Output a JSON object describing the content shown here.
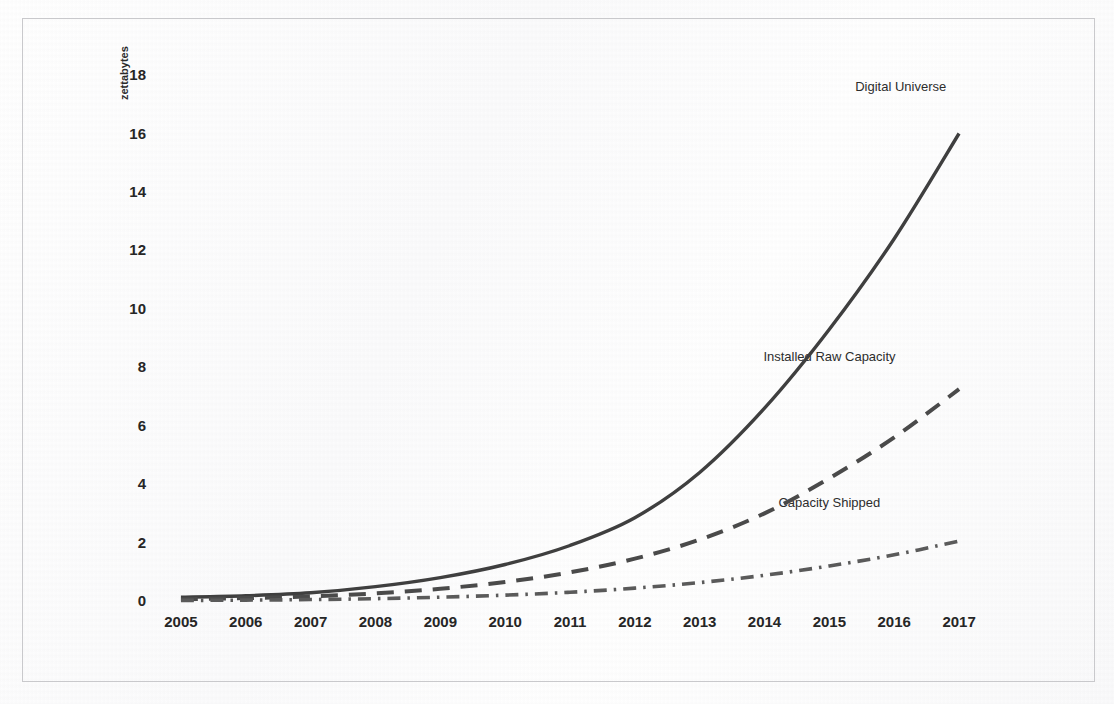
{
  "chart_data": {
    "type": "line",
    "title": "",
    "xlabel": "",
    "ylabel": "zettabytes",
    "x": [
      2005,
      2006,
      2007,
      2008,
      2009,
      2010,
      2011,
      2012,
      2013,
      2014,
      2015,
      2016,
      2017
    ],
    "xtick_labels": [
      "2005",
      "2006",
      "2007",
      "2008",
      "2009",
      "2010",
      "2011",
      "2012",
      "2013",
      "2014",
      "2015",
      "2016",
      "2017"
    ],
    "ytick_labels": [
      "0",
      "2",
      "4",
      "6",
      "8",
      "10",
      "12",
      "14",
      "16",
      "18"
    ],
    "ytick_values": [
      0,
      2,
      4,
      6,
      8,
      10,
      12,
      14,
      16,
      18
    ],
    "ylim": [
      0,
      19.2
    ],
    "xlim": [
      2004.6,
      2017.4
    ],
    "grid": false,
    "legend_position": "inline-end-of-line",
    "series": [
      {
        "name": "Digital Universe",
        "line_style": "solid",
        "color": "#3f3f3f",
        "width": 3.4,
        "label_x": 2016.1,
        "label_y": 17.6,
        "values": [
          0.13,
          0.18,
          0.28,
          0.49,
          0.8,
          1.25,
          1.9,
          2.85,
          4.4,
          6.6,
          9.3,
          12.4,
          16.0
        ]
      },
      {
        "name": "Installed Raw Capacity",
        "line_style": "dashed",
        "color": "#4a4a4a",
        "width": 4.0,
        "label_x": 2015.0,
        "label_y": 8.35,
        "values": [
          0.06,
          0.1,
          0.16,
          0.26,
          0.42,
          0.65,
          0.98,
          1.45,
          2.1,
          3.0,
          4.2,
          5.6,
          7.25
        ]
      },
      {
        "name": "Capacity Shipped",
        "line_style": "dashdot",
        "color": "#5a5a5a",
        "width": 3.6,
        "label_x": 2015.0,
        "label_y": 3.35,
        "values": [
          0.02,
          0.03,
          0.05,
          0.08,
          0.13,
          0.2,
          0.3,
          0.44,
          0.63,
          0.88,
          1.2,
          1.58,
          2.05
        ]
      }
    ]
  },
  "figure": {
    "frame_color": "#c9c9cc",
    "background": "#fdfdfd",
    "text_color": "#262626"
  }
}
